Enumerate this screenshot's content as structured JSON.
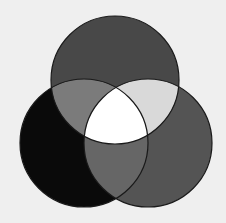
{
  "diagram": {
    "type": "venn-3",
    "background": "#efefef",
    "stroke": "#1a1a1a",
    "circles": [
      {
        "id": "top",
        "cx": 115,
        "cy": 80,
        "r": 64,
        "fill": "#484848"
      },
      {
        "id": "left",
        "cx": 84,
        "cy": 143,
        "r": 64,
        "fill": "#0a0a0a"
      },
      {
        "id": "right",
        "cx": 148,
        "cy": 143,
        "r": 64,
        "fill": "#545454"
      }
    ],
    "regions": {
      "top_left": "#7b7b7b",
      "top_right": "#d9d9d9",
      "left_right": "#666666",
      "center": "#ffffff"
    }
  }
}
